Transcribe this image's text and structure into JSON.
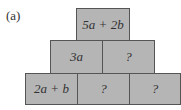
{
  "label": "(a)",
  "pyramid": {
    "top": [
      {
        "text": "5a + 2b"
      }
    ],
    "middle": [
      {
        "text": "3a"
      },
      {
        "text": "?"
      }
    ],
    "bottom": [
      {
        "text": "2a + b"
      },
      {
        "text": "?"
      },
      {
        "text": "?"
      }
    ]
  },
  "colors": {
    "box_fill": "#b5b5b5",
    "border": "#555555"
  }
}
